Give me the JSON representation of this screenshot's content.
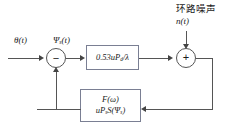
{
  "diagram": {
    "input_signal_label": "θ(t)",
    "error_signal_label": "Ψ",
    "error_signal_sub": "s",
    "error_signal_tail": "(t)",
    "forward_block": {
      "expression_prefix": "0.53uP",
      "expression_sub": "d",
      "expression_suffix": "/λ"
    },
    "feedback_block": {
      "line1": "F(ω)",
      "line2_prefix": "uP",
      "line2_sub1": "s",
      "line2_mid": "S(Ψ",
      "line2_sub2": "s",
      "line2_suffix": ")"
    },
    "summing_left_sign": "−",
    "summing_right_sign": "+",
    "noise": {
      "caption": "环路噪声",
      "signal": "n(t)"
    },
    "colors": {
      "line": "#555555",
      "block_border": "#7a7f93",
      "text": "#1a1a1a",
      "background": "#ffffff"
    }
  }
}
